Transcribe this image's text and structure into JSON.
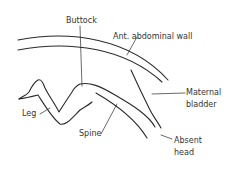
{
  "figure": {
    "type": "anatomical-line-diagram",
    "labels": {
      "buttock": "Buttock",
      "abdominal_wall": "Ant.  abdominal wall",
      "maternal_bladder_line1": "Maternal",
      "maternal_bladder_line2": "bladder",
      "leg": "Leg",
      "spine": "Spine",
      "absent_head_line1": "Absent",
      "absent_head_line2": "head"
    }
  }
}
